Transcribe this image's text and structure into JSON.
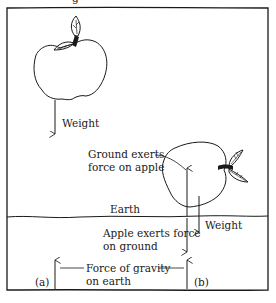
{
  "diagram": {
    "top_caption_fragment": "g",
    "labels": {
      "weight_top": "Weight",
      "ground_exerts_line1": "Ground exerts",
      "ground_exerts_line2": "force on apple",
      "earth": "Earth",
      "weight_right": "Weight",
      "apple_exerts_line1": "Apple exerts force",
      "apple_exerts_line2": "on ground",
      "gravity_line1": "Force of gravity",
      "gravity_line2": "on earth",
      "panel_a": "(a)",
      "panel_b": "(b)"
    },
    "colors": {
      "ink": "#1a1a1a",
      "background": "#ffffff"
    }
  }
}
